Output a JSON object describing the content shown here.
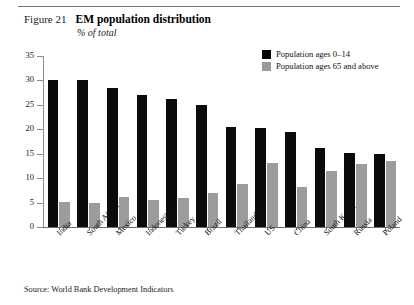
{
  "figure": {
    "number_label": "Figure 21",
    "title": "EM population distribution",
    "subtitle": "% of total",
    "source": "Source: World Bank Development Indicators"
  },
  "colors": {
    "series_young": "#0b0b0b",
    "series_old": "#9c9c9c",
    "axis": "#6e6e6e",
    "rule": "#777777",
    "background": "#ffffff"
  },
  "legend": {
    "position": "top-right",
    "entries": [
      {
        "label": "Population ages 0–14",
        "color": "#0b0b0b",
        "swatch": "black"
      },
      {
        "label": "Population ages 65 and above",
        "color": "#9c9c9c",
        "swatch": "gray"
      }
    ]
  },
  "chart_data": {
    "type": "bar",
    "title": "EM population distribution",
    "subtitle": "% of total",
    "xlabel": "",
    "ylabel": "",
    "ylim": [
      0,
      35
    ],
    "yticks": [
      0,
      5,
      10,
      15,
      20,
      25,
      30,
      35
    ],
    "ytick_labels": [
      "0",
      "5",
      "10",
      "15",
      "20",
      "25",
      "30",
      "35"
    ],
    "grid": false,
    "legend_position": "top-right",
    "categories": [
      "India",
      "South Africa",
      "Mexico",
      "Indonesia",
      "Turkey",
      "Brazil",
      "Thailand",
      "US",
      "China",
      "South Korea",
      "Russia",
      "Poland"
    ],
    "series": [
      {
        "name": "Population ages 0–14",
        "color": "#0b0b0b",
        "values": [
          30.1,
          30.0,
          28.5,
          27.0,
          26.2,
          25.0,
          20.4,
          20.3,
          19.4,
          16.1,
          15.2,
          15.0
        ]
      },
      {
        "name": "Population ages 65 and above",
        "color": "#9c9c9c",
        "values": [
          5.1,
          4.9,
          6.2,
          5.5,
          6.0,
          7.0,
          8.9,
          13.1,
          8.2,
          11.5,
          13.0,
          13.6
        ]
      }
    ],
    "source": "Source: World Bank Development Indicators"
  }
}
